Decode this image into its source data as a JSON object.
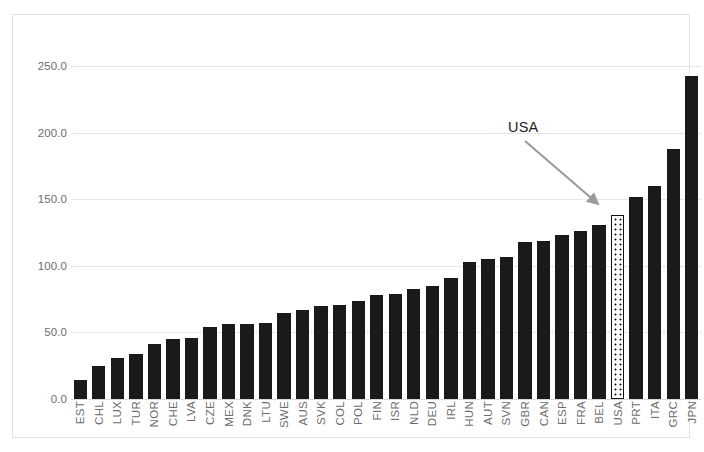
{
  "chart_data": {
    "type": "bar",
    "title": "",
    "subtitle": "",
    "xlabel": "",
    "ylabel": "",
    "ylim": [
      0,
      260
    ],
    "grid": true,
    "legend": "none",
    "ytick_labels": [
      "0.0",
      "50.0",
      "100.0",
      "150.0",
      "200.0",
      "250.0"
    ],
    "ytick_values": [
      0,
      50,
      100,
      150,
      200,
      250
    ],
    "categories": [
      "EST",
      "CHL",
      "LUX",
      "TUR",
      "NOR",
      "CHE",
      "LVA",
      "CZE",
      "MEX",
      "DNK",
      "LTU",
      "SWE",
      "AUS",
      "SVK",
      "COL",
      "POL",
      "FIN",
      "ISR",
      "NLD",
      "DEU",
      "IRL",
      "HUN",
      "AUT",
      "SVN",
      "GBR",
      "CAN",
      "ESP",
      "FRA",
      "BEL",
      "USA",
      "PRT",
      "ITA",
      "GRC",
      "JPN"
    ],
    "values": [
      14,
      25,
      31,
      34,
      41,
      45,
      46,
      54,
      56,
      56,
      57,
      65,
      67,
      70,
      71,
      74,
      78,
      79,
      83,
      85,
      91,
      103,
      105,
      107,
      118,
      119,
      123,
      126,
      131,
      138,
      152,
      160,
      188,
      243
    ],
    "highlighted_category": "USA",
    "highlight_style": "dotted-pattern-white-fill",
    "bar_color": "#1a1a1a",
    "highlight_border_color": "#111111",
    "annotations": [
      {
        "text": "USA",
        "target_category": "USA",
        "arrow_color": "#9a9a9a",
        "type": "arrow-label"
      }
    ]
  }
}
